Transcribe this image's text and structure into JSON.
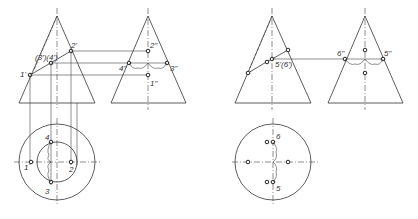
{
  "figure": {
    "left_group": {
      "front_view_labels": {
        "p1": "1'",
        "p2": "2'",
        "p34": "(3')(4')"
      },
      "side_view_labels": {
        "p1": "1\"",
        "p2": "2\"",
        "p3": "3\"",
        "p4": "4\""
      },
      "top_view_labels": {
        "p1": "1",
        "p2": "2",
        "p3": "3",
        "p4": "4"
      }
    },
    "right_group": {
      "front_view_labels": {
        "p56": "5'(6')"
      },
      "side_view_labels": {
        "p5": "5\"",
        "p6": "6\""
      },
      "top_view_labels": {
        "p5": "5",
        "p6": "6"
      }
    },
    "colors": {
      "line": "#333333",
      "background": "#ffffff"
    }
  }
}
